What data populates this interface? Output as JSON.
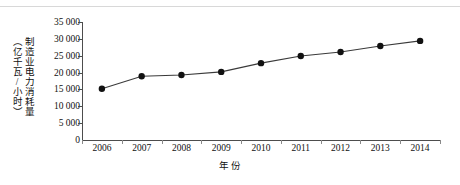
{
  "chart_data": {
    "type": "line",
    "title": "",
    "xlabel": "年 份",
    "ylabel": "制造业电力消耗量（亿千瓦/小时）",
    "ylabel_line1": "制造业电力消耗量",
    "ylabel_line2": "（亿千瓦/小时）",
    "categories": [
      "2006",
      "2007",
      "2008",
      "2009",
      "2010",
      "2011",
      "2012",
      "2013",
      "2014"
    ],
    "values": [
      15200,
      18900,
      19300,
      20200,
      22800,
      24900,
      26100,
      27900,
      29400
    ],
    "series": [
      {
        "name": "制造业电力消耗量",
        "values": [
          15200,
          18900,
          19300,
          20200,
          22800,
          24900,
          26100,
          27900,
          29400
        ]
      }
    ],
    "ylim": [
      0,
      35000
    ],
    "ytick_labels": [
      "0",
      "5 000",
      "10 000",
      "15 000",
      "20 000",
      "25 000",
      "30 000",
      "35 000"
    ],
    "yticks": [
      0,
      5000,
      10000,
      15000,
      20000,
      25000,
      30000,
      35000
    ],
    "grid": false,
    "legend": "none",
    "marker": "filled-circle",
    "line_color": "#3a3a3a",
    "marker_color": "#111111"
  }
}
